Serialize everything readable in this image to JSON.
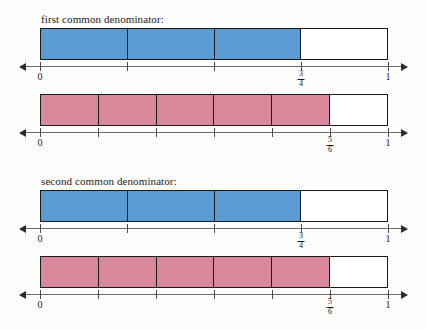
{
  "page": {
    "width": 427,
    "height": 329,
    "background": "#fdfdfc"
  },
  "colors": {
    "blue_fill": "#5b9bd3",
    "pink_fill": "#d9879b",
    "outline": "#1a1a1a",
    "axis": "#6c6c6c",
    "text": "#1b1b1b"
  },
  "sections": [
    {
      "caption": "first common denominator:",
      "rows": [
        {
          "name": "blue-bar-row-1",
          "segments": 4,
          "filled": 3,
          "fill_color": "#5b9bd3",
          "ticks": [
            {
              "label": "0",
              "type": "plain",
              "pos": 0
            },
            {
              "label": "",
              "type": "none",
              "pos": 0.25
            },
            {
              "label": "",
              "type": "none",
              "pos": 0.5
            },
            {
              "label": "3/4",
              "type": "fraction",
              "numerator": "3",
              "denominator": "4",
              "pos": 0.75
            },
            {
              "label": "1",
              "type": "plain",
              "pos": 1
            }
          ]
        },
        {
          "name": "pink-bar-row-1",
          "segments": 6,
          "filled": 5,
          "fill_color": "#d9879b",
          "ticks": [
            {
              "label": "0",
              "type": "plain",
              "pos": 0
            },
            {
              "label": "",
              "type": "none",
              "pos": 0.16666
            },
            {
              "label": "",
              "type": "none",
              "pos": 0.33333
            },
            {
              "label": "",
              "type": "none",
              "pos": 0.5
            },
            {
              "label": "",
              "type": "none",
              "pos": 0.66666
            },
            {
              "label": "5/6",
              "type": "fraction",
              "numerator": "5",
              "denominator": "6",
              "pos": 0.83333
            },
            {
              "label": "1",
              "type": "plain",
              "pos": 1
            }
          ]
        }
      ]
    },
    {
      "caption": "second common denominator:",
      "rows": [
        {
          "name": "blue-bar-row-2",
          "segments": 4,
          "filled": 3,
          "fill_color": "#5b9bd3",
          "ticks": [
            {
              "label": "0",
              "type": "plain",
              "pos": 0
            },
            {
              "label": "",
              "type": "none",
              "pos": 0.25
            },
            {
              "label": "",
              "type": "none",
              "pos": 0.5
            },
            {
              "label": "3/4",
              "type": "fraction",
              "numerator": "3",
              "denominator": "4",
              "pos": 0.75
            },
            {
              "label": "1",
              "type": "plain",
              "pos": 1
            }
          ]
        },
        {
          "name": "pink-bar-row-2",
          "segments": 6,
          "filled": 5,
          "fill_color": "#d9879b",
          "ticks": [
            {
              "label": "0",
              "type": "plain",
              "pos": 0
            },
            {
              "label": "",
              "type": "none",
              "pos": 0.16666
            },
            {
              "label": "",
              "type": "none",
              "pos": 0.33333
            },
            {
              "label": "",
              "type": "none",
              "pos": 0.5
            },
            {
              "label": "",
              "type": "none",
              "pos": 0.66666
            },
            {
              "label": "5/6",
              "type": "fraction",
              "numerator": "5",
              "denominator": "6",
              "pos": 0.83333
            },
            {
              "label": "1",
              "type": "plain",
              "pos": 1
            }
          ]
        }
      ]
    }
  ],
  "geometry": {
    "bar_left": 40,
    "bar_right": 388,
    "bar_height": 32,
    "axis_left": 25,
    "axis_right": 402,
    "section_tops": [
      14,
      176
    ],
    "caption_offset": 0,
    "row_bar_offsets": [
      14,
      80
    ],
    "row_axis_offsets": [
      52,
      118
    ],
    "row_label_offsets": [
      57,
      123
    ]
  }
}
